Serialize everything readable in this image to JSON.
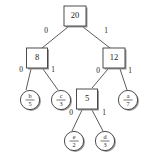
{
  "diagram": {
    "colors": {
      "background": "#ffffff",
      "stroke": "#3a3a3a",
      "edge": "#4a4a4a",
      "shadow": "#9a9a9a",
      "text": "#1a1a1a"
    },
    "internal_nodes": [
      {
        "id": "root",
        "label": "20",
        "x": 75,
        "y": 16,
        "w": 22,
        "h": 20
      },
      {
        "id": "n8",
        "label": "8",
        "x": 37,
        "y": 58,
        "w": 21,
        "h": 20
      },
      {
        "id": "n12",
        "label": "12",
        "x": 114,
        "y": 58,
        "w": 22,
        "h": 20
      },
      {
        "id": "n5",
        "label": "5",
        "x": 87,
        "y": 99,
        "w": 21,
        "h": 20
      }
    ],
    "leaf_nodes": [
      {
        "id": "leaf_b",
        "symbol": "b",
        "weight": "5",
        "x": 30,
        "y": 100,
        "r": 10
      },
      {
        "id": "leaf_c",
        "symbol": "c",
        "weight": "3",
        "x": 61,
        "y": 100,
        "r": 10
      },
      {
        "id": "leaf_a",
        "symbol": "a",
        "weight": "7",
        "x": 128,
        "y": 100,
        "r": 10
      },
      {
        "id": "leaf_e",
        "symbol": "e",
        "weight": "2",
        "x": 74,
        "y": 141,
        "r": 10
      },
      {
        "id": "leaf_d",
        "symbol": "d",
        "weight": "3",
        "x": 105,
        "y": 141,
        "r": 10
      }
    ],
    "edges": [
      {
        "id": "e-root-n8",
        "from": "root",
        "to": "n8",
        "label": "0",
        "x1": 68,
        "y1": 27,
        "x2": 42,
        "y2": 48,
        "lx": 46,
        "ly": 31
      },
      {
        "id": "e-root-n12",
        "from": "root",
        "to": "n12",
        "label": "1",
        "x1": 83,
        "y1": 27,
        "x2": 110,
        "y2": 48,
        "lx": 106,
        "ly": 31
      },
      {
        "id": "e-n8-leafb",
        "from": "n8",
        "to": "leaf_b",
        "label": "0",
        "x1": 31,
        "y1": 69,
        "x2": 26,
        "y2": 90,
        "lx": 21,
        "ly": 70
      },
      {
        "id": "e-n8-leafc",
        "from": "n8",
        "to": "leaf_c",
        "label": "1",
        "x1": 43,
        "y1": 69,
        "x2": 58,
        "y2": 90,
        "lx": 53,
        "ly": 70
      },
      {
        "id": "e-n12-n5",
        "from": "n12",
        "to": "n5",
        "label": "0",
        "x1": 108,
        "y1": 69,
        "x2": 92,
        "y2": 88,
        "lx": 98,
        "ly": 71
      },
      {
        "id": "e-n12-leafa",
        "from": "n12",
        "to": "leaf_a",
        "label": "1",
        "x1": 120,
        "y1": 69,
        "x2": 127,
        "y2": 90,
        "lx": 130,
        "ly": 71
      },
      {
        "id": "e-n5-leafe",
        "from": "n5",
        "to": "leaf_e",
        "label": "0",
        "x1": 82,
        "y1": 110,
        "x2": 72,
        "y2": 131,
        "lx": 71,
        "ly": 113
      },
      {
        "id": "e-n5-leafd",
        "from": "n5",
        "to": "leaf_d",
        "label": "1",
        "x1": 92,
        "y1": 110,
        "x2": 103,
        "y2": 131,
        "lx": 104,
        "ly": 113
      }
    ]
  }
}
